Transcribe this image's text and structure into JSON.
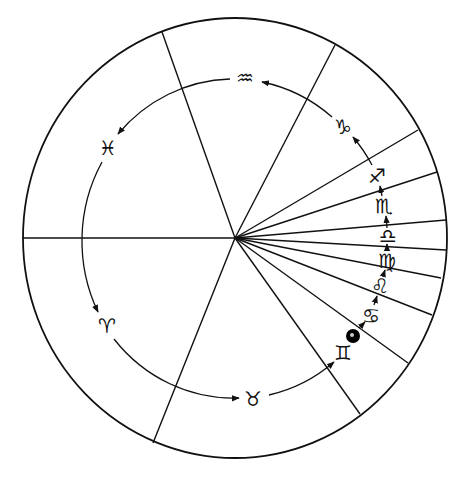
{
  "diagram": {
    "type": "zodiac-wheel",
    "colors": {
      "ink": "#111111",
      "background": "#ffffff",
      "planet_fill": "#000000"
    },
    "outer_circle": {
      "cx": 235,
      "cy": 238,
      "rx": 212,
      "ry": 220
    },
    "center_hub": {
      "x": 235,
      "y": 238
    },
    "horizontal_axis": {
      "x1": 22,
      "y1": 238,
      "x2": 235,
      "y2": 238
    },
    "spokes": [
      {
        "x": 162,
        "y": 32
      },
      {
        "x": 335,
        "y": 45
      },
      {
        "x": 418,
        "y": 130
      },
      {
        "x": 437,
        "y": 172
      },
      {
        "x": 446,
        "y": 220
      },
      {
        "x": 446,
        "y": 250
      },
      {
        "x": 441,
        "y": 278
      },
      {
        "x": 432,
        "y": 315
      },
      {
        "x": 408,
        "y": 363
      },
      {
        "x": 360,
        "y": 414
      },
      {
        "x": 153,
        "y": 443
      }
    ],
    "signs": [
      {
        "name": "Aquarius",
        "glyph": "♒",
        "x": 245,
        "y": 78,
        "icon": "aquarius-icon"
      },
      {
        "name": "Pisces",
        "glyph": "♓",
        "x": 108,
        "y": 148,
        "icon": "pisces-icon"
      },
      {
        "name": "Aries",
        "glyph": "♈",
        "x": 107,
        "y": 326,
        "icon": "aries-icon"
      },
      {
        "name": "Taurus",
        "glyph": "♉",
        "x": 253,
        "y": 399,
        "icon": "taurus-icon"
      },
      {
        "name": "Gemini",
        "glyph": "♊",
        "x": 343,
        "y": 353,
        "icon": "gemini-icon"
      },
      {
        "name": "Cancer",
        "glyph": "♋",
        "x": 371,
        "y": 316,
        "icon": "cancer-icon"
      },
      {
        "name": "Leo",
        "glyph": "♌",
        "x": 380,
        "y": 286,
        "icon": "leo-icon"
      },
      {
        "name": "Virgo",
        "glyph": "♍",
        "x": 387,
        "y": 261,
        "icon": "virgo-icon"
      },
      {
        "name": "Libra",
        "glyph": "♎",
        "x": 388,
        "y": 236,
        "icon": "libra-icon"
      },
      {
        "name": "Scorpio",
        "glyph": "♏",
        "x": 384,
        "y": 206,
        "icon": "scorpio-icon"
      },
      {
        "name": "Sagittarius",
        "glyph": "♐",
        "x": 377,
        "y": 176,
        "icon": "sagittarius-icon"
      },
      {
        "name": "Capricorn",
        "glyph": "♑",
        "x": 343,
        "y": 127,
        "icon": "capricorn-icon"
      }
    ],
    "planet_marker": {
      "x": 353,
      "y": 336,
      "r": 7
    }
  }
}
